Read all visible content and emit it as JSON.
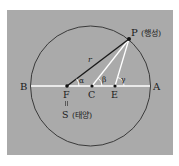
{
  "diagram": {
    "type": "planetary-orbit-geometry",
    "colors": {
      "background": "#aaaaaa",
      "border": "#ffffff",
      "circle": "#3a3a3a",
      "axis_line": "#ffffff",
      "radius_line": "#1a1a1a",
      "helper_lines": "#ffffff"
    },
    "circle": {
      "cx": 90.5,
      "cy": 86,
      "r": 60
    },
    "points": {
      "P": {
        "label": "P",
        "annotation": "(행성)",
        "x": 129,
        "y": 39
      },
      "F": {
        "label": "F",
        "x": 67,
        "y": 86
      },
      "C": {
        "label": "C",
        "x": 92,
        "y": 86
      },
      "E": {
        "label": "E",
        "x": 115,
        "y": 86
      },
      "A": {
        "label": "A",
        "x": 155,
        "y": 86
      },
      "B": {
        "label": "B",
        "x": 24,
        "y": 86
      },
      "S": {
        "label": "S",
        "annotation": "(태양)"
      }
    },
    "equivalence_mark": "=",
    "segments": [
      {
        "from": "F",
        "to": "P",
        "label": "r"
      },
      {
        "from": "C",
        "to": "P"
      },
      {
        "from": "E",
        "to": "P"
      },
      {
        "from": "B",
        "to": "A"
      }
    ],
    "angles": [
      {
        "vertex": "F",
        "label": "α"
      },
      {
        "vertex": "C",
        "label": "β"
      },
      {
        "vertex": "E",
        "label": "γ"
      }
    ],
    "labels": {
      "P": "P",
      "P_note": "(행성)",
      "S": "S",
      "S_note": "(태양)",
      "F": "F",
      "C": "C",
      "E": "E",
      "A": "A",
      "B": "B",
      "r": "r",
      "alpha": "α",
      "beta": "β",
      "gamma": "γ",
      "eq": "="
    }
  }
}
